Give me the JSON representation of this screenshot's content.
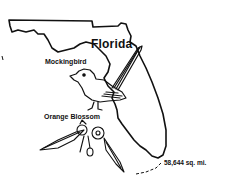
{
  "illustration": {
    "state_name": "Florida",
    "state_bird_label": "Mockingbird",
    "state_flower_label": "Orange Blossom",
    "area_label": "58,644 sq. mi.",
    "line_color": "#111111",
    "background_color": "#ffffff"
  }
}
